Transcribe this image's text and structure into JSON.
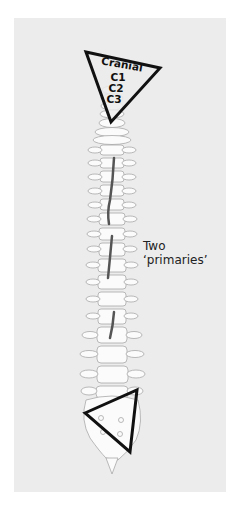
{
  "figure": {
    "background_color": "#ececec",
    "bone_fill": "#fbfbfb",
    "bone_stroke": "#a8a8a8",
    "lesion_color": "#555555",
    "marker_color": "#111111"
  },
  "cranial_marker": {
    "title": "Cranial",
    "levels": [
      "C1",
      "C2",
      "C3"
    ]
  },
  "caudal_marker": {
    "label": ""
  },
  "annotation": {
    "line1": "Two",
    "line2": "‘primaries’"
  }
}
